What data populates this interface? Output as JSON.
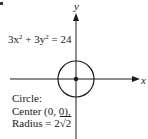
{
  "figure": {
    "axes": {
      "x_label": "x",
      "y_label": "y"
    },
    "equation": {
      "coef_x": "3x",
      "exp_x": "2",
      "plus": " + 3y",
      "exp_y": "2",
      "rhs": " = 24"
    },
    "info": {
      "line1": "Circle:",
      "line2": "Center (0, 0),",
      "line3_prefix": "Radius = 2",
      "line3_radical": "√2"
    },
    "circle": {
      "center_px": [
        76,
        79
      ],
      "radius_px": 18,
      "stroke": "#1a1a1a"
    }
  }
}
